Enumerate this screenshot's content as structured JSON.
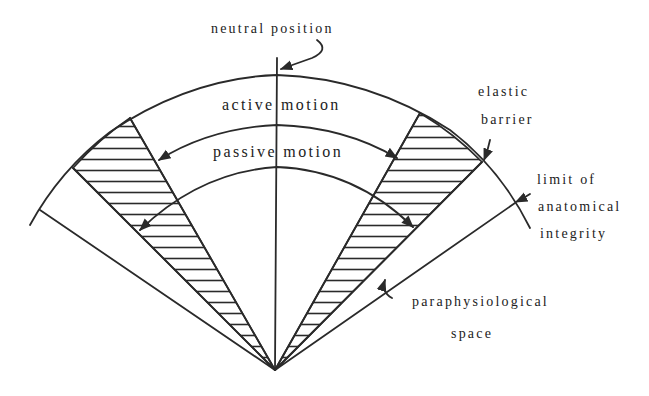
{
  "diagram": {
    "type": "joint range-of-motion sector diagram",
    "labels": {
      "neutral_position": "neutral position",
      "active_motion": "active motion",
      "passive_motion": "passive motion",
      "elastic_barrier_1": "elastic",
      "elastic_barrier_2": "barrier",
      "limit_1": "limit of",
      "limit_2": "anatomical",
      "limit_3": "integrity",
      "paraphysiological_1": "paraphysiological",
      "paraphysiological_2": "space"
    },
    "colors": {
      "line": "#2a2a2a",
      "background": "#ffffff"
    },
    "regions": [
      "active motion range (between arcs)",
      "passive motion range",
      "elastic barrier (hatched zones, left and right)",
      "paraphysiological space",
      "limit of anatomical integrity"
    ]
  }
}
